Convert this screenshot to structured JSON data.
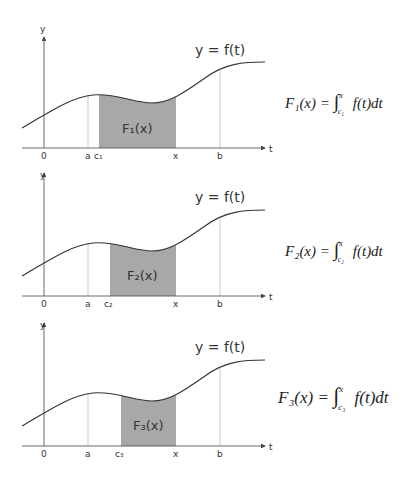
{
  "panels": [
    {
      "y_label": "y",
      "t_label": "t",
      "curve_label": "y = f(t)",
      "ticks": {
        "zero": "0",
        "a": "a",
        "c": "c₁",
        "x": "x",
        "b": "b"
      },
      "region_label": "F₁(x)",
      "formula": {
        "lhs": "F₁(x) = ",
        "integral": "∫",
        "upper": "x",
        "lower": "c₁",
        "rhs": "f(t)dt"
      }
    },
    {
      "y_label": "y",
      "t_label": "t",
      "curve_label": "y = f(t)",
      "ticks": {
        "zero": "0",
        "a": "a",
        "c": "c₂",
        "x": "x",
        "b": "b"
      },
      "region_label": "F₂(x)",
      "formula": {
        "lhs": "F₂(x) = ",
        "integral": "∫",
        "upper": "x",
        "lower": "c₂",
        "rhs": "f(t)dt"
      }
    },
    {
      "y_label": "y",
      "t_label": "t",
      "curve_label": "y = f(t)",
      "ticks": {
        "zero": "0",
        "a": "a",
        "c": "c₃",
        "x": "x",
        "b": "b"
      },
      "region_label": "F₃(x)",
      "formula": {
        "lhs": "F₃(x) = ",
        "integral": "∫",
        "upper": "x",
        "lower": "c₃",
        "rhs": "f(t)dt"
      }
    }
  ],
  "colors": {
    "shade": "#a8a8a8",
    "curve": "#333333",
    "axis": "#444444",
    "guide": "#bbbbbb"
  }
}
